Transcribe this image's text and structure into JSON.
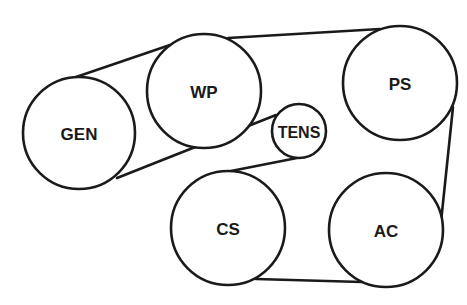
{
  "title": "",
  "pulleys": [
    {
      "id": "GEN",
      "label": "GEN",
      "cx": 79,
      "cy": 133,
      "r": 56,
      "font_size": 17
    },
    {
      "id": "WP",
      "label": "WP",
      "cx": 204,
      "cy": 91,
      "r": 57,
      "font_size": 17
    },
    {
      "id": "TENS",
      "label": "TENS",
      "cx": 299,
      "cy": 131,
      "r": 27,
      "font_size": 16
    },
    {
      "id": "PS",
      "label": "PS",
      "cx": 400,
      "cy": 83,
      "r": 57,
      "font_size": 17
    },
    {
      "id": "CS",
      "label": "CS",
      "cx": 228,
      "cy": 228,
      "r": 57,
      "font_size": 17
    },
    {
      "id": "AC",
      "label": "AC",
      "cx": 386,
      "cy": 230,
      "r": 57,
      "font_size": 17
    }
  ],
  "belt_segments": [
    {
      "from": "GEN",
      "to": "WP",
      "x1": 76,
      "y1": 77,
      "x2": 170,
      "y2": 45
    },
    {
      "from": "WP",
      "to": "PS",
      "x1": 228,
      "y1": 38,
      "x2": 380,
      "y2": 29
    },
    {
      "from": "PS",
      "to": "AC",
      "x1": 453,
      "y1": 107,
      "x2": 441,
      "y2": 222
    },
    {
      "from": "AC",
      "to": "CS",
      "x1": 362,
      "y1": 282,
      "x2": 256,
      "y2": 279
    },
    {
      "from": "CS",
      "to": "TENS",
      "x1": 231,
      "y1": 171,
      "x2": 297,
      "y2": 158
    },
    {
      "from": "TENS",
      "to": "GEN",
      "x1": 276,
      "y1": 115,
      "x2": 117,
      "y2": 178
    }
  ],
  "colors": {
    "stroke": "#1a1a1a",
    "background": "#ffffff"
  }
}
